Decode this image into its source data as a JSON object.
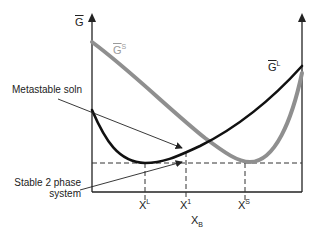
{
  "diagram": {
    "y_axis_label": {
      "base": "G",
      "overbar": true
    },
    "x_axis_label": {
      "base": "X",
      "sub": "B"
    },
    "curves": [
      {
        "id": "G_S",
        "label_base": "G",
        "label_sup": "S",
        "color": "#8f8f8f",
        "width": 4
      },
      {
        "id": "G_L",
        "label_base": "G",
        "label_sup": "L",
        "color": "#111111",
        "width": 2.6
      }
    ],
    "x_markers": [
      {
        "base": "X",
        "sup": "L"
      },
      {
        "base": "X",
        "sup": "1"
      },
      {
        "base": "X",
        "sup": "S"
      }
    ],
    "annotations": [
      {
        "text": "Metastable soln"
      },
      {
        "line1": "Stable 2 phase",
        "line2": "system"
      }
    ],
    "colors": {
      "axis": "#222222",
      "dashed": "#333333",
      "solid_phase": "#8f8f8f",
      "liquid_phase": "#111111"
    }
  }
}
